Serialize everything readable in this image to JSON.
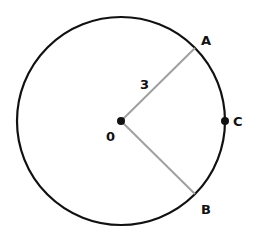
{
  "diagram": {
    "circle": {
      "cx": 121,
      "cy": 121,
      "r": 104,
      "stroke": "#111111"
    },
    "center": {
      "label": "0",
      "x": 121,
      "y": 121
    },
    "points": {
      "A": {
        "label": "A",
        "x": 195,
        "y": 48
      },
      "B": {
        "label": "B",
        "x": 195,
        "y": 194
      },
      "C": {
        "label": "C",
        "x": 225,
        "y": 121
      }
    },
    "radius_label": "3",
    "radius_color": "#a0a0a0"
  }
}
